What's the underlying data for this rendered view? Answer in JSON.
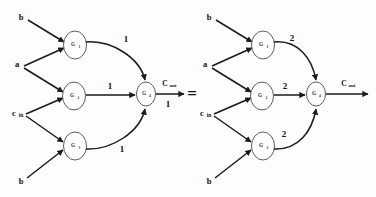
{
  "figure": {
    "equals_sign": "=",
    "background_color": "#fdfdfd",
    "line_color": "#1a1a1a",
    "node_stroke_color": "#4a4a4a",
    "node_fill_color": "#ffffff"
  },
  "left_diagram": {
    "name": "carry-out-circuit-unit-delay",
    "inputs": [
      {
        "id": "in-b-top",
        "label": "b"
      },
      {
        "id": "in-a",
        "label": "a"
      },
      {
        "id": "in-cin",
        "label": "c",
        "sub": "in"
      },
      {
        "id": "in-b-bottom",
        "label": "b"
      }
    ],
    "nodes": [
      {
        "id": "g1",
        "label": "G",
        "sub": "1"
      },
      {
        "id": "g2",
        "label": "G",
        "sub": "2"
      },
      {
        "id": "g3",
        "label": "G",
        "sub": "3"
      },
      {
        "id": "g4",
        "label": "G",
        "sub": "4"
      }
    ],
    "edge_weights": {
      "g1_to_g4": "1",
      "g2_to_g4": "1",
      "g3_to_g4": "1",
      "g4_to_out": "1"
    },
    "output": {
      "id": "out-cout",
      "label": "C",
      "sub": "out"
    }
  },
  "right_diagram": {
    "name": "carry-out-circuit-double-delay",
    "inputs": [
      {
        "id": "in-b-top",
        "label": "b"
      },
      {
        "id": "in-a",
        "label": "a"
      },
      {
        "id": "in-cin",
        "label": "c",
        "sub": "in"
      },
      {
        "id": "in-b-bottom",
        "label": "b"
      }
    ],
    "nodes": [
      {
        "id": "g1",
        "label": "G",
        "sub": "1"
      },
      {
        "id": "g2",
        "label": "G",
        "sub": "2"
      },
      {
        "id": "g3",
        "label": "G",
        "sub": "3"
      },
      {
        "id": "g4",
        "label": "G",
        "sub": "4"
      }
    ],
    "edge_weights": {
      "g1_to_g4": "2",
      "g2_to_g4": "2",
      "g3_to_g4": "2",
      "g4_to_out": ""
    },
    "output": {
      "id": "out-cout",
      "label": "C",
      "sub": "out"
    }
  }
}
